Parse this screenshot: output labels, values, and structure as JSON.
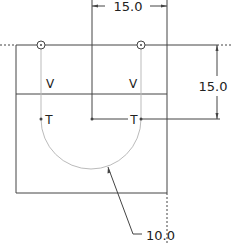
{
  "drawing": {
    "colors": {
      "line": "#444444",
      "construction": "#bbbbbb",
      "text": "#222222"
    },
    "dimensions": {
      "top_horizontal": "15.0",
      "right_vertical": "15.0",
      "arc_radius": "10.0"
    },
    "constraints": {
      "left_vertical": "V",
      "right_vertical": "V",
      "left_tangent": "T",
      "right_tangent": "T"
    }
  }
}
